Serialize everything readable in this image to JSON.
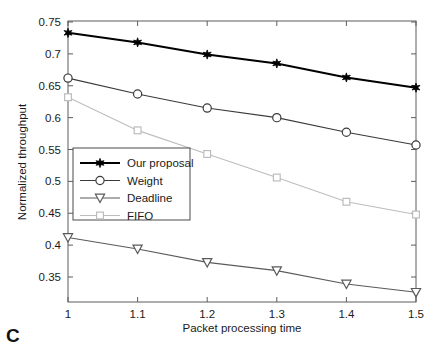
{
  "panel": {
    "letter": "C"
  },
  "chart_data": {
    "type": "line",
    "title": "",
    "xlabel": "Packet processing time",
    "ylabel": "Normalized throughput",
    "x": [
      1,
      1.1,
      1.2,
      1.3,
      1.4,
      1.5
    ],
    "xticklabels": [
      "1",
      "1.1",
      "1.2",
      "1.3",
      "1.4",
      "1.5"
    ],
    "yticks": [
      0.35,
      0.4,
      0.45,
      0.5,
      0.55,
      0.6,
      0.65,
      0.7,
      0.75
    ],
    "yticklabels": [
      "0.35",
      "0.4",
      "0.45",
      "0.5",
      "0.55",
      "0.6",
      "0.65",
      "0.7",
      "0.75"
    ],
    "xlim": [
      1,
      1.5
    ],
    "ylim": [
      0.32,
      0.75
    ],
    "grid": false,
    "legend_position": "center-left",
    "series": [
      {
        "name": "Our proposal",
        "marker": "star",
        "color": "#000000",
        "linewidth": 2.0,
        "values": [
          0.733,
          0.718,
          0.699,
          0.685,
          0.663,
          0.647
        ]
      },
      {
        "name": "Weight",
        "marker": "circle",
        "color": "#3a3a3a",
        "linewidth": 1.1,
        "values": [
          0.662,
          0.637,
          0.615,
          0.6,
          0.577,
          0.557
        ]
      },
      {
        "name": "Deadline",
        "marker": "triangle-down",
        "color": "#5a5a5a",
        "linewidth": 1.1,
        "values": [
          0.412,
          0.394,
          0.373,
          0.36,
          0.339,
          0.326
        ]
      },
      {
        "name": "FIFO",
        "marker": "square",
        "color": "#bdbdbd",
        "linewidth": 1.1,
        "values": [
          0.632,
          0.58,
          0.543,
          0.506,
          0.468,
          0.448
        ]
      }
    ]
  }
}
